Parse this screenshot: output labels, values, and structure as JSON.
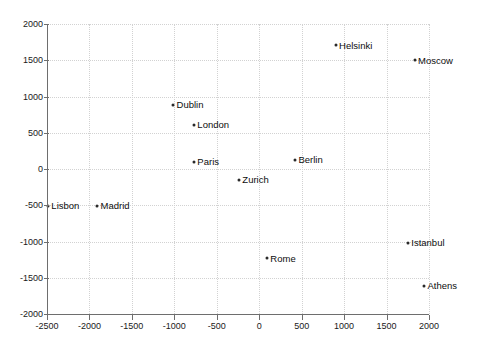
{
  "chart_data": {
    "type": "scatter",
    "title": "",
    "xlabel": "",
    "ylabel": "",
    "xlim": [
      -2500,
      2000
    ],
    "ylim": [
      -2000,
      2000
    ],
    "grid": true,
    "legend": "none",
    "xticks": [
      -2500,
      -2000,
      -1500,
      -1000,
      -500,
      0,
      500,
      1000,
      1500,
      2000
    ],
    "xticklabels": [
      "-2500",
      "-2000",
      "-1500",
      "-1000",
      "-500",
      "0",
      "500",
      "1000",
      "1500",
      "2000"
    ],
    "yticks": [
      -2000,
      -1500,
      -1000,
      -500,
      0,
      500,
      1000,
      1500,
      2000
    ],
    "yticklabels": [
      "-2000",
      "-1500",
      "-1000",
      "-500",
      "0",
      "500",
      "1000",
      "1500",
      "2000"
    ],
    "points": [
      {
        "label": "Helsinki",
        "x": 900,
        "y": 1710
      },
      {
        "label": "Moscow",
        "x": 1830,
        "y": 1500
      },
      {
        "label": "Dublin",
        "x": -1015,
        "y": 885
      },
      {
        "label": "London",
        "x": -770,
        "y": 610
      },
      {
        "label": "Paris",
        "x": -770,
        "y": 100
      },
      {
        "label": "Berlin",
        "x": 420,
        "y": 130
      },
      {
        "label": "Zurich",
        "x": -240,
        "y": -150
      },
      {
        "label": "Lisbon",
        "x": -2490,
        "y": -510
      },
      {
        "label": "Madrid",
        "x": -1910,
        "y": -510
      },
      {
        "label": "Istanbul",
        "x": 1750,
        "y": -1020
      },
      {
        "label": "Rome",
        "x": 90,
        "y": -1230
      },
      {
        "label": "Athens",
        "x": 1940,
        "y": -1610
      }
    ],
    "colors": {
      "marker": "#2a2a2a",
      "label": "#0d0d0d",
      "axis": "#6e6e6e",
      "grid": "#d2d2d2",
      "background": "#ffffff"
    }
  }
}
